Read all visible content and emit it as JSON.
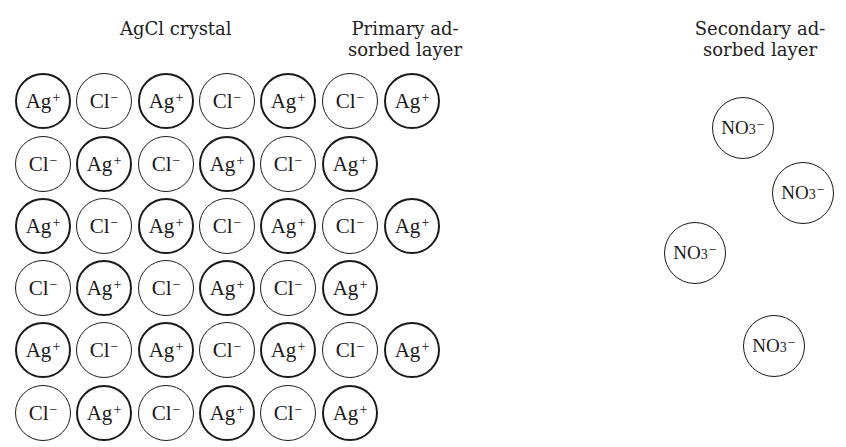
{
  "labels": {
    "crystal": "AgCl crystal",
    "primary_line1": "Primary ad-",
    "primary_line2": "sorbed layer",
    "secondary_line1": "Secondary ad-",
    "secondary_line2": "sorbed layer"
  },
  "ions": {
    "ag": {
      "symbol": "Ag",
      "charge": "+"
    },
    "cl": {
      "symbol": "Cl",
      "charge": "−"
    },
    "no3": {
      "symbol": "NO",
      "subscript": "3",
      "charge": "−"
    }
  },
  "crystal_rows": [
    [
      "Ag+",
      "Cl−",
      "Ag+",
      "Cl−",
      "Ag+",
      "Cl−",
      "Ag+"
    ],
    [
      "Cl−",
      "Ag+",
      "Cl−",
      "Ag+",
      "Cl−",
      "Ag+"
    ],
    [
      "Ag+",
      "Cl−",
      "Ag+",
      "Cl−",
      "Ag+",
      "Cl−",
      "Ag+"
    ],
    [
      "Cl−",
      "Ag+",
      "Cl−",
      "Ag+",
      "Cl−",
      "Ag+"
    ],
    [
      "Ag+",
      "Cl−",
      "Ag+",
      "Cl−",
      "Ag+",
      "Cl−",
      "Ag+"
    ],
    [
      "Cl−",
      "Ag+",
      "Cl−",
      "Ag+",
      "Cl−",
      "Ag+"
    ]
  ],
  "secondary_layer_ions": [
    "NO3−",
    "NO3−",
    "NO3−",
    "NO3−"
  ]
}
